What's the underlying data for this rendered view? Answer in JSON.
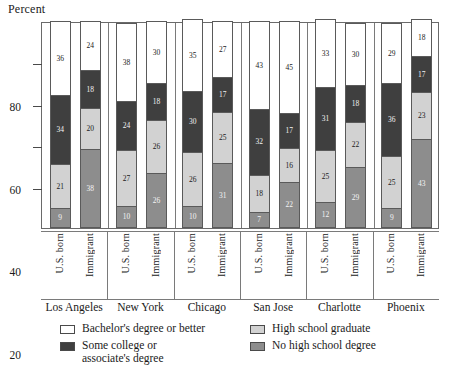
{
  "axis": {
    "y_title": "Percent",
    "y_ticks": [
      20,
      40,
      60,
      80
    ],
    "y_min": 0,
    "y_max": 100
  },
  "legend": [
    {
      "key": "bachelor",
      "label": "Bachelor's degree or better",
      "color": "#ffffff",
      "swatch": "sw-bach"
    },
    {
      "key": "hs",
      "label": "High school graduate",
      "color": "#d2d2d2",
      "swatch": "sw-hs"
    },
    {
      "key": "some",
      "label": "Some college or associate's degree",
      "color": "#3f3f3f",
      "swatch": "sw-some"
    },
    {
      "key": "nohs",
      "label": "No high school degree",
      "color": "#8d8d8d",
      "swatch": "sw-nohs"
    }
  ],
  "groups": [
    {
      "city": "Los Angeles",
      "bars": [
        {
          "nativity": "U.S. born",
          "bachelor": 36,
          "some": 34,
          "hs": 21,
          "nohs": 9
        },
        {
          "nativity": "Immigrant",
          "bachelor": 24,
          "some": 18,
          "hs": 20,
          "nohs": 38
        }
      ]
    },
    {
      "city": "New York",
      "bars": [
        {
          "nativity": "U.S. born",
          "bachelor": 38,
          "some": 24,
          "hs": 27,
          "nohs": 10
        },
        {
          "nativity": "Immigrant",
          "bachelor": 30,
          "some": 18,
          "hs": 26,
          "nohs": 26
        }
      ]
    },
    {
      "city": "Chicago",
      "bars": [
        {
          "nativity": "U.S. born",
          "bachelor": 35,
          "some": 30,
          "hs": 26,
          "nohs": 10
        },
        {
          "nativity": "Immigrant",
          "bachelor": 27,
          "some": 17,
          "hs": 25,
          "nohs": 31
        }
      ]
    },
    {
      "city": "San Jose",
      "bars": [
        {
          "nativity": "U.S. born",
          "bachelor": 43,
          "some": 32,
          "hs": 18,
          "nohs": 7
        },
        {
          "nativity": "Immigrant",
          "bachelor": 45,
          "some": 17,
          "hs": 16,
          "nohs": 22
        }
      ]
    },
    {
      "city": "Charlotte",
      "bars": [
        {
          "nativity": "U.S. born",
          "bachelor": 33,
          "some": 31,
          "hs": 25,
          "nohs": 12
        },
        {
          "nativity": "Immigrant",
          "bachelor": 30,
          "some": 18,
          "hs": 22,
          "nohs": 29
        }
      ]
    },
    {
      "city": "Phoenix",
      "bars": [
        {
          "nativity": "U.S. born",
          "bachelor": 29,
          "some": 36,
          "hs": 25,
          "nohs": 9
        },
        {
          "nativity": "Immigrant",
          "bachelor": 18,
          "some": 17,
          "hs": 23,
          "nohs": 43
        }
      ]
    }
  ],
  "chart_data": {
    "type": "bar",
    "subtype": "stacked-vertical",
    "title": "",
    "xlabel": "",
    "ylabel": "Percent",
    "ylim": [
      0,
      100
    ],
    "yticks": [
      20,
      40,
      60,
      80
    ],
    "grid": false,
    "legend_position": "bottom",
    "categories": [
      "Los Angeles - U.S. born",
      "Los Angeles - Immigrant",
      "New York - U.S. born",
      "New York - Immigrant",
      "Chicago - U.S. born",
      "Chicago - Immigrant",
      "San Jose - U.S. born",
      "San Jose - Immigrant",
      "Charlotte - U.S. born",
      "Charlotte - Immigrant",
      "Phoenix - U.S. born",
      "Phoenix - Immigrant"
    ],
    "group_labels": [
      "Los Angeles",
      "New York",
      "Chicago",
      "San Jose",
      "Charlotte",
      "Phoenix"
    ],
    "subgroup_labels": [
      "U.S. born",
      "Immigrant"
    ],
    "series": [
      {
        "name": "Bachelor's degree or better",
        "color": "#ffffff",
        "values": [
          36,
          24,
          38,
          30,
          35,
          27,
          43,
          45,
          33,
          30,
          29,
          18
        ]
      },
      {
        "name": "Some college or associate's degree",
        "color": "#3f3f3f",
        "values": [
          34,
          18,
          24,
          18,
          30,
          17,
          32,
          17,
          31,
          18,
          36,
          17
        ]
      },
      {
        "name": "High school graduate",
        "color": "#d2d2d2",
        "values": [
          21,
          20,
          27,
          26,
          26,
          25,
          18,
          16,
          25,
          22,
          25,
          23
        ]
      },
      {
        "name": "No high school degree",
        "color": "#8d8d8d",
        "values": [
          9,
          38,
          10,
          26,
          10,
          31,
          7,
          22,
          12,
          29,
          9,
          43
        ]
      }
    ],
    "stack_order_top_to_bottom": [
      "Bachelor's degree or better",
      "Some college or associate's degree",
      "High school graduate",
      "No high school degree"
    ]
  }
}
